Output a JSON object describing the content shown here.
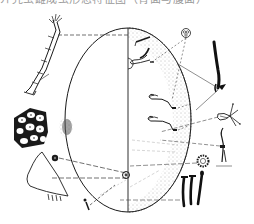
{
  "figure": {
    "caption_partial": "介壳虫雌成虫形态特征图（背面与腹面）",
    "caption_note": "caption cropped at top edge; only lower halves of glyphs visible",
    "background": "#ffffff",
    "ink_color": "#1a1a1a",
    "stipple_color": "#7a7a7a"
  },
  "body": {
    "shape": "oval",
    "left_half": "dorsal view (plain)",
    "right_half": "ventral view (stippled margin)"
  },
  "details": [
    {
      "id": "antenna",
      "position": "upper-left"
    },
    {
      "id": "cuticle-cells",
      "position": "left"
    },
    {
      "id": "anal-plate",
      "position": "lower-left"
    },
    {
      "id": "pore-small",
      "position": "lower-left"
    },
    {
      "id": "tubular-duct",
      "position": "bottom-left"
    },
    {
      "id": "multilocular-pore",
      "position": "upper-right"
    },
    {
      "id": "marginal-seta",
      "position": "upper-right"
    },
    {
      "id": "claw-tarsus",
      "position": "right"
    },
    {
      "id": "dorsal-seta",
      "position": "right"
    },
    {
      "id": "spiracle-ring",
      "position": "lower-right"
    },
    {
      "id": "setae-group",
      "position": "bottom-right"
    }
  ]
}
